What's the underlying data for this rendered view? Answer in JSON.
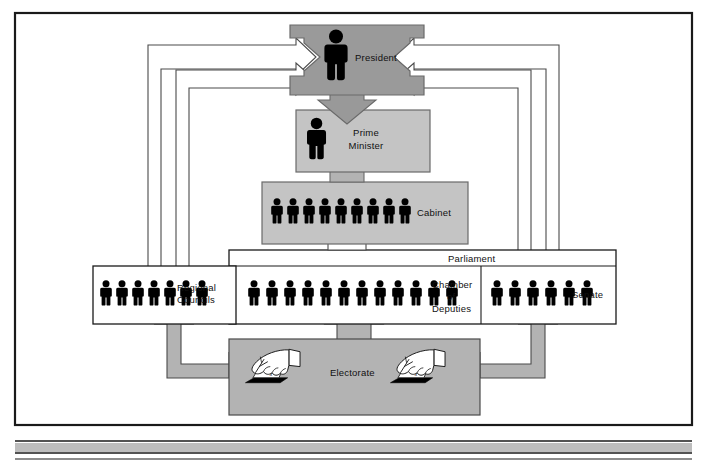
{
  "diagram": {
    "type": "organizational-flow-diagram",
    "colors": {
      "frame_border": "#1a1a1a",
      "president_fill": "#9a9a9a",
      "box_fill": "#c4c4c4",
      "arrow_gray": "#b3b3b3",
      "arrow_white": "#ffffff",
      "figure_black": "#000000",
      "text": "#111111",
      "bottom_band": "#bdbdbd",
      "outline": "#2b2b2b"
    },
    "nodes": {
      "president": {
        "label": "President",
        "figures": 1,
        "fill": "president_fill"
      },
      "prime_minister": {
        "label_line1": "Prime",
        "label_line2": "Minister",
        "figures": 1,
        "fill": "box_fill"
      },
      "cabinet": {
        "label": "Cabinet",
        "figures": 9,
        "fill": "box_fill"
      },
      "parliament": {
        "label": "Parliament",
        "fill": "arrow_white"
      },
      "chamber_of_deputies": {
        "label_line1": "Chamber",
        "label_line2": "of",
        "label_line3": "Deputies",
        "figures": 12,
        "fill": "arrow_white"
      },
      "senate": {
        "label": "Senate",
        "figures": 6,
        "fill": "arrow_white"
      },
      "regional_councils": {
        "label_line1": "Regional",
        "label_line2": "Councils",
        "figures": 7,
        "fill": "arrow_white"
      },
      "electorate": {
        "label": "Electorate",
        "ballot_icons": 2,
        "ballot_mark": "x",
        "fill": "arrow_gray"
      }
    },
    "flows": [
      {
        "from": "electorate",
        "to": "regional_councils",
        "style": "gray-arrow-up"
      },
      {
        "from": "electorate",
        "to": "chamber_of_deputies",
        "style": "gray-arrow-up"
      },
      {
        "from": "electorate",
        "to": "senate",
        "style": "gray-arrow-up"
      },
      {
        "from": "parliament",
        "to": "cabinet",
        "style": "white-arrow-up"
      },
      {
        "from": "cabinet",
        "to": "prime_minister",
        "style": "gray-arrow-up"
      },
      {
        "from": "president",
        "to": "prime_minister",
        "style": "gray-arrow-down"
      },
      {
        "from": "regional_councils",
        "to": "president",
        "style": "white-routed-arrow-left"
      },
      {
        "from": "chamber_of_deputies",
        "to": "president",
        "style": "white-routed-arrow-left-inner"
      },
      {
        "from": "senate",
        "to": "president",
        "style": "white-routed-arrow-right"
      },
      {
        "from": "parliament",
        "to": "president",
        "style": "white-routed-arrow-right-inner"
      }
    ]
  }
}
